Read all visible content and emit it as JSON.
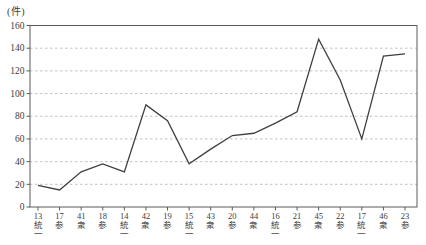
{
  "chart_data": {
    "type": "line",
    "title": "",
    "unit_label": "(件)",
    "xlabel": "",
    "ylabel": "件",
    "categories": [
      "13統一",
      "17参",
      "41衆",
      "18参",
      "14統一",
      "42衆",
      "19参",
      "15統一",
      "43衆",
      "20参",
      "44衆",
      "16統一",
      "21参",
      "45衆",
      "22参",
      "17統一",
      "46衆",
      "23参"
    ],
    "values": [
      19,
      15,
      31,
      38,
      31,
      90,
      76,
      38,
      51,
      63,
      65,
      74,
      84,
      148,
      112,
      60,
      133,
      135
    ],
    "ylim": [
      0,
      160
    ],
    "ytick_step": 20,
    "yticks": [
      0,
      20,
      40,
      60,
      80,
      100,
      120,
      140,
      160
    ],
    "grid": "horizontal-dashed",
    "legend": "none",
    "colors": {
      "line": "#3f3f3f",
      "grid": "#b3b3b3",
      "axis": "#5a5a5a",
      "text": "#3c3c3c",
      "background": "#ffffff"
    }
  }
}
